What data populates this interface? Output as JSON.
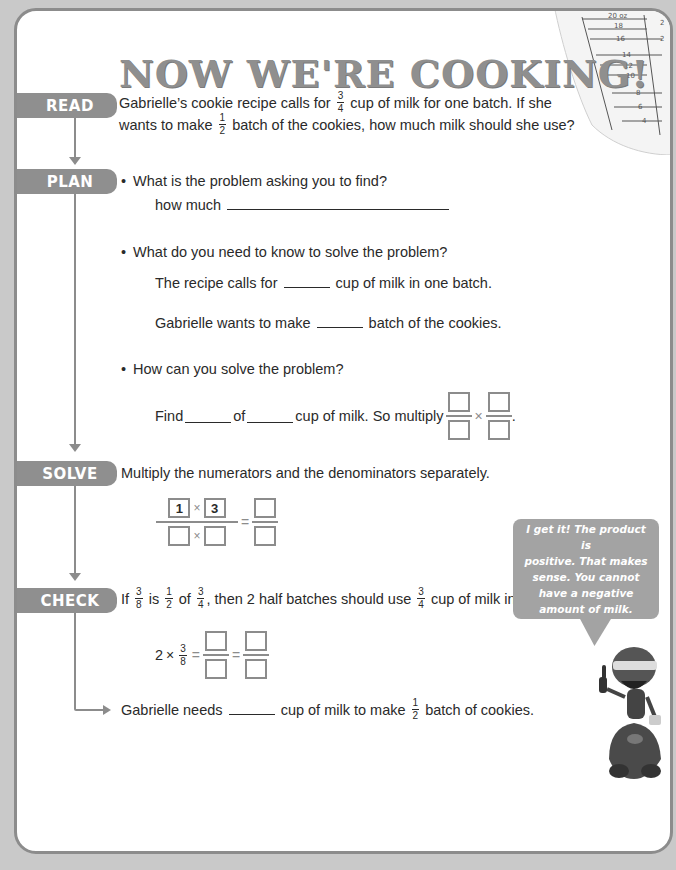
{
  "title": "NOW WE'RE COOKING!",
  "steps": {
    "read": "READ",
    "plan": "PLAN",
    "solve": "SOLVE",
    "check": "CHECK"
  },
  "read": {
    "line1_a": "Gabrielle’s cookie recipe calls for",
    "line1_frac_num": "3",
    "line1_frac_den": "4",
    "line1_b": "cup of milk for one batch. If she",
    "line2_a": "wants to make",
    "line2_frac_num": "1",
    "line2_frac_den": "2",
    "line2_b": "batch of the cookies, how much milk should she use?"
  },
  "plan": {
    "q1": "What is the problem asking you to find?",
    "q1_answer_prefix": "how much",
    "q2": "What do you need to know to solve the problem?",
    "q2_line1_a": "The recipe calls for",
    "q2_line1_b": "cup of milk in one batch.",
    "q2_line2_a": "Gabrielle wants to make",
    "q2_line2_b": "batch of the cookies.",
    "q3": "How can you solve the problem?",
    "q3_find": "Find",
    "q3_of": "of",
    "q3_rest": "cup of milk. So multiply",
    "q3_period": ".",
    "times": "×"
  },
  "solve": {
    "instruction": "Multiply the numerators and the denominators separately.",
    "num1": "1",
    "num2": "3",
    "times": "×",
    "equals": "="
  },
  "check": {
    "a": "If",
    "f1_num": "3",
    "f1_den": "8",
    "b": "is",
    "f2_num": "1",
    "f2_den": "2",
    "c": "of",
    "f3_num": "3",
    "f3_den": "4",
    "d": ", then 2 half batches should use",
    "f4_num": "3",
    "f4_den": "4",
    "e": "cup of milk in all.",
    "eq_lead": "2",
    "eq_times": "×",
    "eq_frac_num": "3",
    "eq_frac_den": "8",
    "equals": "="
  },
  "conclusion": {
    "a": "Gabrielle needs",
    "b": "cup of milk to make",
    "frac_num": "1",
    "frac_den": "2",
    "c": "batch of cookies."
  },
  "bubble": {
    "text": "I get it! The product is\npositive. That makes\nsense. You cannot\nhave a negative\namount of milk."
  },
  "cup_marks": {
    "oz": [
      "20 oz",
      "18",
      "16",
      "14",
      "12",
      "10",
      "8",
      "6",
      "4"
    ],
    "cups": [
      "2 1/2",
      "2",
      "1 3/4"
    ]
  },
  "colors": {
    "background": "#c9c9c9",
    "frame": "#8c8c8c",
    "tab": "#8f8f8f",
    "title": "#8f8f8f",
    "bubble": "#a3a3a3"
  }
}
